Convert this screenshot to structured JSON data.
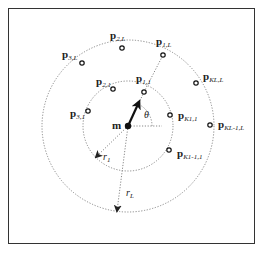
{
  "diagram": {
    "center": {
      "label": "m",
      "x": 128,
      "y": 126
    },
    "angle_label": "θ",
    "radii": [
      {
        "label": "r",
        "sub": "1",
        "r": 45
      },
      {
        "label": "r",
        "sub": "L",
        "r": 86
      }
    ],
    "points": [
      {
        "id": "p11",
        "base": "p",
        "sub": "1,1",
        "x": 144,
        "y": 92,
        "lx": 136,
        "ly": 82
      },
      {
        "id": "p21",
        "base": "p",
        "sub": "2,1",
        "x": 113,
        "y": 89,
        "lx": 96,
        "ly": 85
      },
      {
        "id": "p31",
        "base": "p",
        "sub": "3,1",
        "x": 88,
        "y": 111,
        "lx": 70,
        "ly": 117
      },
      {
        "id": "pK11",
        "base": "p",
        "sub": "K1,1",
        "x": 170,
        "y": 115,
        "lx": 178,
        "ly": 119
      },
      {
        "id": "pK111",
        "base": "p",
        "sub": "K1-1,1",
        "x": 169,
        "y": 150,
        "lx": 177,
        "ly": 157
      },
      {
        "id": "p1L",
        "base": "p",
        "sub": "1,L",
        "x": 163,
        "y": 55,
        "lx": 156,
        "ly": 45
      },
      {
        "id": "p2L",
        "base": "p",
        "sub": "2,L",
        "x": 122,
        "y": 48,
        "lx": 110,
        "ly": 39
      },
      {
        "id": "p3L",
        "base": "p",
        "sub": "3,L",
        "x": 82,
        "y": 63,
        "lx": 62,
        "ly": 58
      },
      {
        "id": "pKLL",
        "base": "p",
        "sub": "KL,L",
        "x": 196,
        "y": 83,
        "lx": 203,
        "ly": 80
      },
      {
        "id": "pKL1L",
        "base": "p",
        "sub": "KL-1,L",
        "x": 210,
        "y": 125,
        "lx": 218,
        "ly": 128
      }
    ]
  }
}
